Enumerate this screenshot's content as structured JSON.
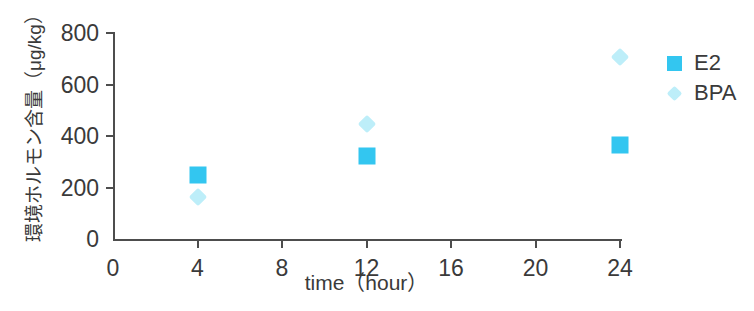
{
  "chart_data": {
    "type": "scatter",
    "title": "",
    "xlabel": "time（hour）",
    "ylabel": "環境ホルモン含量（μg/kg）",
    "xlim": [
      0,
      24
    ],
    "ylim": [
      0,
      800
    ],
    "x_ticks": [
      0,
      4,
      8,
      12,
      16,
      20,
      24
    ],
    "y_ticks": [
      0,
      200,
      400,
      600,
      800
    ],
    "x_ticklabels": [
      "0",
      "4",
      "8",
      "12",
      "16",
      "20",
      "24"
    ],
    "y_ticklabels": [
      "0",
      "200",
      "400",
      "600",
      "800"
    ],
    "grid": false,
    "legend_position": "right",
    "x": [
      4,
      12,
      24
    ],
    "series": [
      {
        "name": "E2",
        "marker": "square",
        "color": "#33c6f0",
        "values": [
          250,
          322,
          365
        ]
      },
      {
        "name": "BPA",
        "marker": "diamond",
        "color": "#bdeef9",
        "values": [
          163,
          448,
          705
        ]
      }
    ]
  },
  "legend": {
    "items": [
      {
        "label": "E2",
        "marker": "square-marker",
        "color": "#33c6f0"
      },
      {
        "label": "BPA",
        "marker": "diamond-marker",
        "color": "#bdeef9"
      }
    ]
  },
  "colors": {
    "axis": "#4d4d4d",
    "text": "#3a3a3a",
    "background": "#ffffff",
    "e2": "#33c6f0",
    "bpa": "#bdeef9"
  }
}
